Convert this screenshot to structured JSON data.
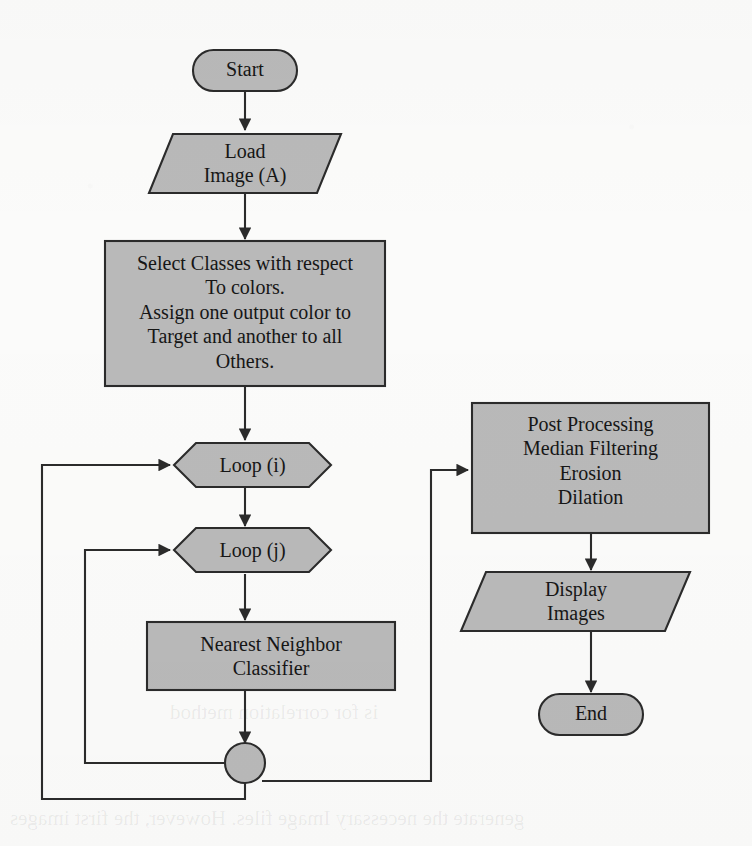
{
  "diagram": {
    "type": "flowchart",
    "fill_color": "#b9b9b9",
    "stroke_color": "#2b2b2b",
    "text_color": "#161616",
    "background_color": "#fbfbfa"
  },
  "nodes": {
    "start": {
      "label": "Start",
      "shape": "terminator"
    },
    "load_image": {
      "label": "Load\nImage (A)",
      "shape": "parallelogram"
    },
    "select_classes": {
      "label": "Select Classes with respect\nTo colors.\nAssign one output color to\nTarget and another to all\nOthers.",
      "shape": "process"
    },
    "loop_i": {
      "label": "Loop (i)",
      "shape": "hexagon"
    },
    "loop_j": {
      "label": "Loop (j)",
      "shape": "hexagon"
    },
    "classifier": {
      "label": "Nearest Neighbor\nClassifier",
      "shape": "process"
    },
    "junction": {
      "label": "",
      "shape": "circle"
    },
    "post_processing": {
      "label": "Post Processing\nMedian Filtering\nErosion\nDilation",
      "shape": "process"
    },
    "display_images": {
      "label": "Display\nImages",
      "shape": "parallelogram"
    },
    "end": {
      "label": "End",
      "shape": "terminator"
    }
  },
  "edges": [
    {
      "from": "start",
      "to": "load_image",
      "style": "arrow"
    },
    {
      "from": "load_image",
      "to": "select_classes",
      "style": "arrow"
    },
    {
      "from": "select_classes",
      "to": "loop_i",
      "style": "arrow"
    },
    {
      "from": "loop_i",
      "to": "loop_j",
      "style": "arrow"
    },
    {
      "from": "loop_j",
      "to": "classifier",
      "style": "arrow"
    },
    {
      "from": "classifier",
      "to": "junction",
      "style": "arrow"
    },
    {
      "from": "junction",
      "to": "loop_j",
      "style": "arrow-loopback-inner"
    },
    {
      "from": "junction",
      "to": "loop_i",
      "style": "arrow-loopback-outer"
    },
    {
      "from": "junction",
      "to": "post_processing",
      "style": "arrow-right-branch"
    },
    {
      "from": "post_processing",
      "to": "display_images",
      "style": "arrow"
    },
    {
      "from": "display_images",
      "to": "end",
      "style": "arrow"
    }
  ],
  "ghost_text": {
    "line_1": "is for correlation method",
    "line_2": "generate the necessary Image files. However, the first images"
  }
}
